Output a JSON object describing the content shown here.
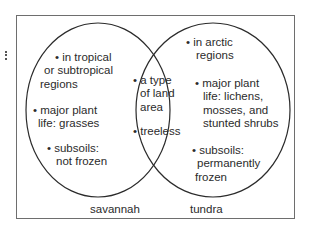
{
  "diagram": {
    "type": "venn",
    "left_set": {
      "label": "savannah",
      "items": [
        {
          "line1": "• in tropical",
          "line2": "or subtropical",
          "line3": "regions"
        },
        {
          "line1": "• major plant",
          "line2": "life: grasses"
        },
        {
          "line1": "• subsoils:",
          "line2": "not frozen"
        }
      ]
    },
    "overlap": {
      "items": [
        {
          "line1": "• a type",
          "line2": "of land",
          "line3": "area"
        },
        {
          "line1": "• treeless"
        }
      ]
    },
    "right_set": {
      "label": "tundra",
      "items": [
        {
          "line1": "• in arctic",
          "line2": "regions"
        },
        {
          "line1": "• major plant",
          "line2": "life: lichens,",
          "line3": "mosses, and",
          "line4": "stunted shrubs"
        },
        {
          "line1": "• subsoils:",
          "line2": "permanently",
          "line3": "frozen"
        }
      ]
    },
    "colors": {
      "stroke": "#2b2b2b",
      "frame": "#6e6e6e",
      "background": "#ffffff"
    }
  }
}
